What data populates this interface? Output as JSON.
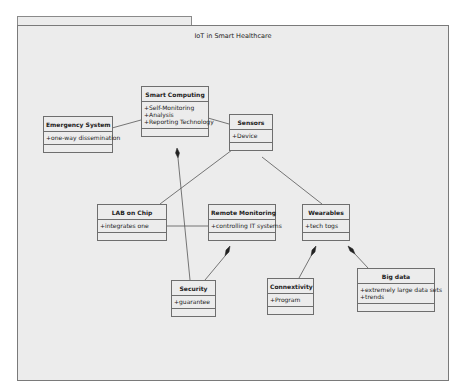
{
  "diagram": {
    "title": "IoT in Smart Healthcare",
    "classes": [
      {
        "id": "emergency",
        "name": "Emergency System",
        "attributes": [
          "+one-way dissemination"
        ]
      },
      {
        "id": "smart",
        "name": "Smart Computing",
        "attributes": [
          "+Self-Monitoring",
          "+Analysis",
          "+Reporting Technology"
        ]
      },
      {
        "id": "sensors",
        "name": "Sensors",
        "attributes": [
          "+Device"
        ]
      },
      {
        "id": "lab",
        "name": "LAB on Chip",
        "attributes": [
          "+integrates one"
        ]
      },
      {
        "id": "remote",
        "name": "Remote Monitoring",
        "attributes": [
          "+controlling IT systems"
        ]
      },
      {
        "id": "wearables",
        "name": "Wearables",
        "attributes": [
          "+tech togs"
        ]
      },
      {
        "id": "security",
        "name": "Security",
        "attributes": [
          "+guarantee"
        ]
      },
      {
        "id": "connectivity",
        "name": "Connextivity",
        "attributes": [
          "+Program"
        ]
      },
      {
        "id": "bigdata",
        "name": "Big data",
        "attributes": [
          "+extremely large data sets",
          "+trends"
        ]
      }
    ],
    "relations": [
      {
        "from": "emergency",
        "to": "smart",
        "type": "association"
      },
      {
        "from": "smart",
        "to": "sensors",
        "type": "association"
      },
      {
        "from": "smart",
        "to": "security",
        "type": "composition"
      },
      {
        "from": "sensors",
        "to": "lab",
        "type": "association"
      },
      {
        "from": "sensors",
        "to": "wearables",
        "type": "association"
      },
      {
        "from": "lab",
        "to": "remote",
        "type": "association"
      },
      {
        "from": "remote",
        "to": "security",
        "type": "composition"
      },
      {
        "from": "wearables",
        "to": "connectivity",
        "type": "composition"
      },
      {
        "from": "wearables",
        "to": "bigdata",
        "type": "composition"
      }
    ]
  }
}
